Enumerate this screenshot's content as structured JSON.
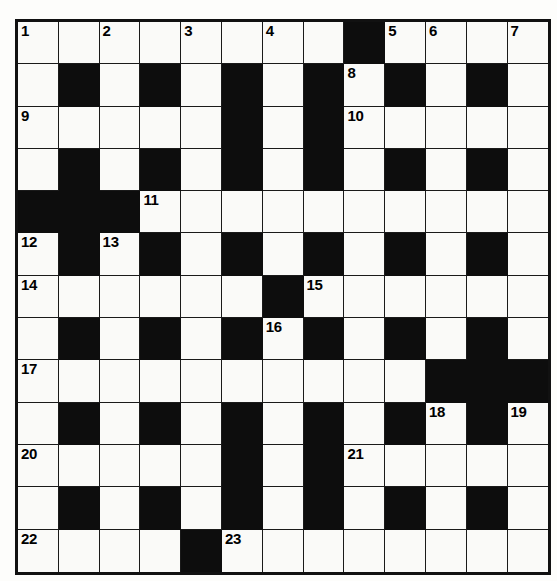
{
  "puzzle": {
    "kind": "crossword-grid",
    "rows": 13,
    "cols": 13,
    "colors": {
      "block": "#0d0d0d",
      "light": "#fafaf8",
      "grid_line": "#1a1a1a",
      "border": "#111111",
      "number_text": "#000000",
      "page_background": "#ffffff"
    },
    "grid": [
      [
        "light",
        "light",
        "light",
        "light",
        "light",
        "light",
        "light",
        "light",
        "block",
        "light",
        "light",
        "light",
        "light"
      ],
      [
        "light",
        "block",
        "light",
        "block",
        "light",
        "block",
        "light",
        "block",
        "light",
        "block",
        "light",
        "block",
        "light"
      ],
      [
        "light",
        "light",
        "light",
        "light",
        "light",
        "block",
        "light",
        "block",
        "light",
        "light",
        "light",
        "light",
        "light"
      ],
      [
        "light",
        "block",
        "light",
        "block",
        "light",
        "block",
        "light",
        "block",
        "light",
        "block",
        "light",
        "block",
        "light"
      ],
      [
        "block",
        "block",
        "block",
        "light",
        "light",
        "light",
        "light",
        "light",
        "light",
        "light",
        "light",
        "light",
        "light"
      ],
      [
        "light",
        "block",
        "light",
        "block",
        "light",
        "block",
        "light",
        "block",
        "light",
        "block",
        "light",
        "block",
        "light"
      ],
      [
        "light",
        "light",
        "light",
        "light",
        "light",
        "light",
        "block",
        "light",
        "light",
        "light",
        "light",
        "light",
        "light"
      ],
      [
        "light",
        "block",
        "light",
        "block",
        "light",
        "block",
        "light",
        "block",
        "light",
        "block",
        "light",
        "block",
        "light"
      ],
      [
        "light",
        "light",
        "light",
        "light",
        "light",
        "light",
        "light",
        "light",
        "light",
        "light",
        "block",
        "block",
        "block"
      ],
      [
        "light",
        "block",
        "light",
        "block",
        "light",
        "block",
        "light",
        "block",
        "light",
        "block",
        "light",
        "block",
        "light"
      ],
      [
        "light",
        "light",
        "light",
        "light",
        "light",
        "block",
        "light",
        "block",
        "light",
        "light",
        "light",
        "light",
        "light"
      ],
      [
        "light",
        "block",
        "light",
        "block",
        "light",
        "block",
        "light",
        "block",
        "light",
        "block",
        "light",
        "block",
        "light"
      ],
      [
        "light",
        "light",
        "light",
        "light",
        "block",
        "light",
        "light",
        "light",
        "light",
        "light",
        "light",
        "light",
        "light"
      ]
    ],
    "numbers": [
      {
        "row": 0,
        "col": 0,
        "label": "1"
      },
      {
        "row": 0,
        "col": 2,
        "label": "2"
      },
      {
        "row": 0,
        "col": 4,
        "label": "3"
      },
      {
        "row": 0,
        "col": 6,
        "label": "4"
      },
      {
        "row": 0,
        "col": 9,
        "label": "5"
      },
      {
        "row": 0,
        "col": 10,
        "label": "6"
      },
      {
        "row": 0,
        "col": 12,
        "label": "7"
      },
      {
        "row": 1,
        "col": 8,
        "label": "8"
      },
      {
        "row": 2,
        "col": 0,
        "label": "9"
      },
      {
        "row": 2,
        "col": 8,
        "label": "10"
      },
      {
        "row": 4,
        "col": 3,
        "label": "11"
      },
      {
        "row": 5,
        "col": 0,
        "label": "12"
      },
      {
        "row": 5,
        "col": 2,
        "label": "13"
      },
      {
        "row": 6,
        "col": 0,
        "label": "14"
      },
      {
        "row": 6,
        "col": 7,
        "label": "15"
      },
      {
        "row": 7,
        "col": 6,
        "label": "16"
      },
      {
        "row": 8,
        "col": 0,
        "label": "17"
      },
      {
        "row": 9,
        "col": 10,
        "label": "18"
      },
      {
        "row": 9,
        "col": 12,
        "label": "19"
      },
      {
        "row": 10,
        "col": 0,
        "label": "20"
      },
      {
        "row": 10,
        "col": 8,
        "label": "21"
      },
      {
        "row": 12,
        "col": 0,
        "label": "22"
      },
      {
        "row": 12,
        "col": 5,
        "label": "23"
      }
    ]
  }
}
